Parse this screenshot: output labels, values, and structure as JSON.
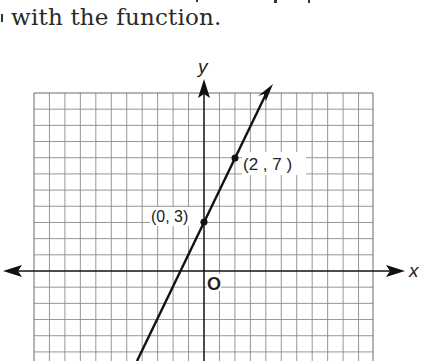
{
  "text": {
    "caption": "with the function."
  },
  "chart_data": {
    "type": "line",
    "title": "",
    "xlabel": "x",
    "ylabel": "y",
    "origin_label": "O",
    "grid": true,
    "series": [
      {
        "name": "line",
        "equation": "y = 2x + 3",
        "slope": 2,
        "intercept": 3,
        "x": [
          -4.3,
          0,
          2,
          4.25
        ],
        "y": [
          -5.6,
          3,
          7,
          11.5
        ]
      }
    ],
    "labeled_points": [
      {
        "x": 0,
        "y": 3,
        "label": "(0, 3)"
      },
      {
        "x": 2,
        "y": 7,
        "label": "(2 , 7 )"
      }
    ],
    "xlim": [
      -11,
      11
    ],
    "ylim": [
      -5.6,
      11
    ]
  },
  "labels": {
    "y_axis": "y",
    "x_axis": "x",
    "origin": "O",
    "point_a": "(0, 3)",
    "point_b": "(2 , 7 )"
  }
}
